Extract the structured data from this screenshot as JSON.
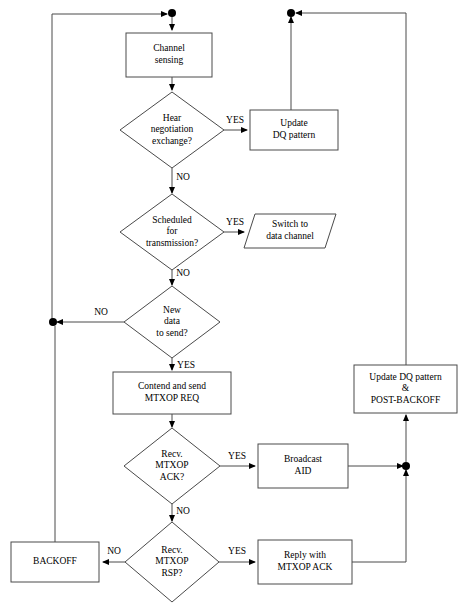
{
  "diagram": {
    "stroke_color": "#4a4a4a",
    "text_color": "#000000",
    "background_color": "#ffffff",
    "nodes": [
      {
        "id": "channel-sensing",
        "shape": "process",
        "x": 126,
        "y": 33,
        "w": 86,
        "h": 44,
        "lines": [
          "Channel",
          "sensing"
        ]
      },
      {
        "id": "hear-negotiation",
        "shape": "decision",
        "cx": 172,
        "cy": 130,
        "rx": 52,
        "ry": 38,
        "lines": [
          "Hear",
          "negotiation",
          "exchange?"
        ]
      },
      {
        "id": "update-dq-pattern",
        "shape": "process",
        "x": 250,
        "y": 110,
        "w": 88,
        "h": 40,
        "lines": [
          "Update",
          "DQ pattern"
        ]
      },
      {
        "id": "scheduled-for-transmission",
        "shape": "decision",
        "cx": 172,
        "cy": 232,
        "rx": 52,
        "ry": 38,
        "lines": [
          "Scheduled",
          "for",
          "transmission?"
        ]
      },
      {
        "id": "switch-to-data-channel",
        "shape": "io",
        "x": 244,
        "y": 214,
        "w": 92,
        "h": 34,
        "skew": 11,
        "lines": [
          "Switch to",
          "data channel"
        ]
      },
      {
        "id": "new-data-to-send",
        "shape": "decision",
        "cx": 172,
        "cy": 322,
        "rx": 48,
        "ry": 36,
        "lines": [
          "New",
          "data",
          "to send?"
        ]
      },
      {
        "id": "contend-and-send",
        "shape": "process",
        "x": 113,
        "y": 372,
        "w": 118,
        "h": 42,
        "lines": [
          "Contend and send",
          "MTXOP REQ"
        ]
      },
      {
        "id": "update-dq-postbackoff",
        "shape": "process",
        "x": 354,
        "y": 365,
        "w": 103,
        "h": 48,
        "lines": [
          "Update DQ pattern",
          "&",
          "POST-BACKOFF"
        ]
      },
      {
        "id": "recv-mtxop-ack",
        "shape": "decision",
        "cx": 172,
        "cy": 466,
        "rx": 48,
        "ry": 38,
        "lines": [
          "Recv.",
          "MTXOP",
          "ACK?"
        ]
      },
      {
        "id": "broadcast-aid",
        "shape": "process",
        "x": 258,
        "y": 444,
        "w": 90,
        "h": 44,
        "lines": [
          "Broadcast",
          "AID"
        ]
      },
      {
        "id": "recv-mtxop-rsp",
        "shape": "decision",
        "cx": 172,
        "cy": 562,
        "rx": 47,
        "ry": 40,
        "lines": [
          "Recv.",
          "MTXOP",
          "RSP?"
        ]
      },
      {
        "id": "backoff",
        "shape": "process",
        "x": 11,
        "y": 542,
        "w": 88,
        "h": 40,
        "lines": [
          "BACKOFF"
        ]
      },
      {
        "id": "reply-with-mtxop-ack",
        "shape": "process",
        "x": 258,
        "y": 540,
        "w": 94,
        "h": 44,
        "lines": [
          "Reply with",
          "MTXOP ACK"
        ]
      }
    ],
    "edges": [
      {
        "id": "top-to-channel-sensing",
        "path": "M172,14 L172,30",
        "arrow": "end"
      },
      {
        "id": "channel-sensing-to-hear",
        "path": "M172,77 L172,90",
        "arrow": "end"
      },
      {
        "id": "hear-yes-to-update-dq",
        "path": "M224,130 L247,130",
        "arrow": "end",
        "label": "YES",
        "label_x": 235,
        "label_y": 121
      },
      {
        "id": "update-dq-to-top",
        "path": "M291,110 L291,17",
        "arrow": "end"
      },
      {
        "id": "hear-no-to-scheduled",
        "path": "M172,168 L172,193",
        "arrow": "end",
        "label": "NO",
        "label_x": 183,
        "label_y": 178
      },
      {
        "id": "scheduled-yes-to-switch",
        "path": "M224,232 L244,232",
        "arrow": "end",
        "label": "YES",
        "label_x": 235,
        "label_y": 223
      },
      {
        "id": "scheduled-no-to-newdata",
        "path": "M172,270 L172,285",
        "arrow": "end",
        "label": "NO",
        "label_x": 183,
        "label_y": 274
      },
      {
        "id": "newdata-no-to-left-rail",
        "path": "M124,322 L57,322",
        "arrow": "end",
        "label": "NO",
        "label_x": 101,
        "label_y": 313
      },
      {
        "id": "left-rail-up-to-top",
        "path": "M52,322 L52,14 L167,14",
        "arrow": "end"
      },
      {
        "id": "newdata-yes-to-contend",
        "path": "M172,358 L172,370",
        "arrow": "end",
        "label": "YES",
        "label_x": 186,
        "label_y": 366
      },
      {
        "id": "contend-to-recv-ack",
        "path": "M172,414 L172,427",
        "arrow": "end"
      },
      {
        "id": "recv-ack-yes-to-broadcast",
        "path": "M220,466 L255,466",
        "arrow": "end",
        "label": "YES",
        "label_x": 237,
        "label_y": 457
      },
      {
        "id": "broadcast-to-right-rail",
        "path": "M348,466 L403,466",
        "arrow": "end"
      },
      {
        "id": "right-rail-up-to-postbackoff",
        "path": "M406,462 L406,415",
        "arrow": "end"
      },
      {
        "id": "postbackoff-up-to-top",
        "path": "M406,365 L406,13 L296,13",
        "arrow": "end"
      },
      {
        "id": "recv-ack-no-to-recv-rsp",
        "path": "M172,504 L172,521",
        "arrow": "end",
        "label": "NO",
        "label_x": 183,
        "label_y": 512
      },
      {
        "id": "recv-rsp-no-to-backoff",
        "path": "M125,562 L103,562",
        "arrow": "end",
        "label": "NO",
        "label_x": 114,
        "label_y": 552
      },
      {
        "id": "recv-rsp-yes-to-reply",
        "path": "M219,562 L255,562",
        "arrow": "end",
        "label": "YES",
        "label_x": 237,
        "label_y": 552
      },
      {
        "id": "reply-to-right-rail-up",
        "path": "M352,562 L406,562 L406,470",
        "arrow": "end"
      },
      {
        "id": "backoff-up-to-left-rail",
        "path": "M55,542 L55,326",
        "arrow": "none"
      }
    ],
    "junctions": [
      {
        "id": "junction-top-left",
        "cx": 172,
        "cy": 13,
        "r": 4
      },
      {
        "id": "junction-top-right",
        "cx": 291,
        "cy": 13,
        "r": 4
      },
      {
        "id": "junction-left-rail",
        "cx": 53,
        "cy": 322,
        "r": 4
      },
      {
        "id": "junction-right-rail",
        "cx": 406,
        "cy": 466,
        "r": 4
      }
    ]
  }
}
